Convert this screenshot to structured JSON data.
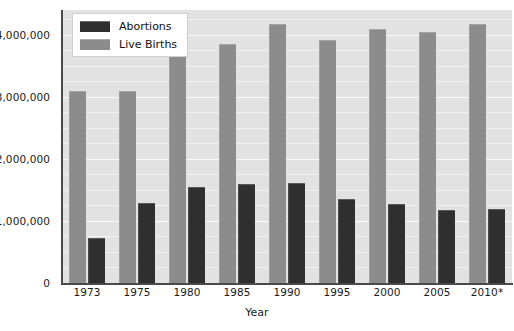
{
  "chart_data": {
    "type": "bar",
    "title": "",
    "subtitle": "",
    "xlabel": "Year",
    "ylabel": "",
    "categories": [
      "1973",
      "1975",
      "1980",
      "1985",
      "1990",
      "1995",
      "2000",
      "2005",
      "2010*"
    ],
    "series": [
      {
        "name": "Abortions",
        "color": "#2f2f2f",
        "values": [
          730000,
          1290000,
          1550000,
          1590000,
          1610000,
          1360000,
          1270000,
          1180000,
          1190000
        ]
      },
      {
        "name": "Live Births",
        "color": "#8c8c8c",
        "values": [
          3100000,
          3100000,
          3790000,
          3850000,
          4180000,
          3920000,
          4090000,
          4040000,
          4180000
        ]
      }
    ],
    "ylim": [
      0,
      4400000
    ],
    "y_ticks": [
      0,
      1000000,
      2000000,
      3000000,
      4000000
    ],
    "y_tick_labels": [
      "0",
      "1,000,000",
      "2,000,000",
      "3,000,000",
      "4,000,000"
    ],
    "y_minor_step": 250000,
    "grid": true,
    "grid_color": "#fbfbfb",
    "plot_background": "#e2e2e2",
    "legend_position": "top-left",
    "bar_order_in_group": [
      "Live Births",
      "Abortions"
    ],
    "annotations": [
      "Asterisk on 2010 label indicates provisional or estimated data"
    ]
  },
  "legend": {
    "entries": [
      {
        "label": "Abortions",
        "swatch": "dark-swatch"
      },
      {
        "label": "Live Births",
        "swatch": "light-swatch"
      }
    ]
  },
  "axes": {
    "x_title": "Year"
  }
}
